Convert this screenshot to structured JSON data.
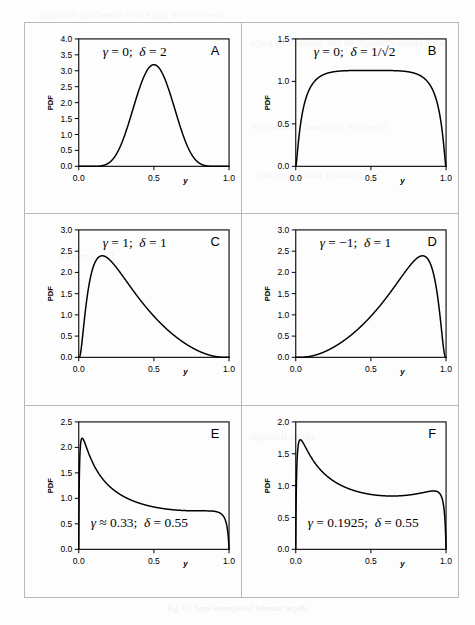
{
  "figure": {
    "caption": "Fig. D1 Some examples of Johnson Sʙ pdfs",
    "panel_count": 6,
    "xlabel": "y",
    "ylabel": "PDF"
  },
  "ghost_text": [
    {
      "text": "the reverse page text bleeding through",
      "x": 40,
      "y": 8
    },
    {
      "text": "faint show-through of the preceding page",
      "x": 250,
      "y": 36
    },
    {
      "text": "illegible reversed characters",
      "x": 252,
      "y": 120
    },
    {
      "text": "ghosted paragraph text",
      "x": 254,
      "y": 168
    },
    {
      "text": "faint marks",
      "x": 60,
      "y": 250
    },
    {
      "text": "show through",
      "x": 250,
      "y": 430
    }
  ],
  "chart_data": [
    {
      "id": "A",
      "type": "line",
      "letter": "A",
      "annotation": "γ = 0 ; δ = 2",
      "annotation_parts": {
        "gamma_symbol": "γ",
        "gamma_value": "0",
        "delta_symbol": "δ",
        "delta_value": "2"
      },
      "gamma": 0,
      "delta": 2,
      "title": "",
      "xlabel": "y",
      "ylabel": "PDF",
      "xlim": [
        0,
        1
      ],
      "ylim": [
        0,
        4.0
      ],
      "xticks": [
        0.0,
        0.5,
        1.0
      ],
      "xticklabels": [
        "0.0",
        "0.5",
        "1.0"
      ],
      "yticks": [
        0.0,
        0.5,
        1.0,
        1.5,
        2.0,
        2.5,
        3.0,
        3.5,
        4.0
      ],
      "yticklabels": [
        "0.0",
        "0.5",
        "1.0",
        "1.5",
        "2.0",
        "2.5",
        "3.0",
        "3.5",
        "4.0"
      ],
      "grid": false,
      "legend": null,
      "peak": {
        "y": 0.5,
        "pdf": 3.19
      }
    },
    {
      "id": "B",
      "type": "line",
      "letter": "B",
      "annotation": "γ = 0; δ = 1/√2",
      "annotation_parts": {
        "gamma_symbol": "γ",
        "gamma_value": "0",
        "delta_symbol": "δ",
        "delta_value": "1/√2"
      },
      "gamma": 0,
      "delta": 0.7071067811865476,
      "title": "",
      "xlabel": "y",
      "ylabel": "PDF",
      "xlim": [
        0,
        1
      ],
      "ylim": [
        0,
        1.5
      ],
      "xticks": [
        0.0,
        0.5,
        1.0
      ],
      "xticklabels": [
        "0.0",
        "0.5",
        "1.0"
      ],
      "yticks": [
        0.0,
        0.5,
        1.0,
        1.5
      ],
      "yticklabels": [
        "0.0",
        "0.5",
        "1.0",
        "1.5"
      ],
      "grid": false,
      "legend": null,
      "peak": {
        "y": 0.5,
        "pdf": 1.13
      }
    },
    {
      "id": "C",
      "type": "line",
      "letter": "C",
      "annotation": "γ = 1; δ = 1",
      "annotation_parts": {
        "gamma_symbol": "γ",
        "gamma_value": "1",
        "delta_symbol": "δ",
        "delta_value": "1"
      },
      "gamma": 1,
      "delta": 1,
      "title": "",
      "xlabel": "y",
      "ylabel": "PDF",
      "xlim": [
        0,
        1
      ],
      "ylim": [
        0,
        3.0
      ],
      "xticks": [
        0.0,
        0.5,
        1.0
      ],
      "xticklabels": [
        "0.0",
        "0.5",
        "1.0"
      ],
      "yticks": [
        0.0,
        0.5,
        1.0,
        1.5,
        2.0,
        2.5,
        3.0
      ],
      "yticklabels": [
        "0.0",
        "0.5",
        "1.0",
        "1.5",
        "2.0",
        "2.5",
        "3.0"
      ],
      "grid": false,
      "legend": null,
      "peak": {
        "y": 0.16,
        "pdf": 2.41
      }
    },
    {
      "id": "D",
      "type": "line",
      "letter": "D",
      "annotation": "γ = −1; δ = 1",
      "annotation_parts": {
        "gamma_symbol": "γ",
        "gamma_value": "−1",
        "delta_symbol": "δ",
        "delta_value": "1"
      },
      "gamma": -1,
      "delta": 1,
      "title": "",
      "xlabel": "y",
      "ylabel": "PDF",
      "xlim": [
        0,
        1
      ],
      "ylim": [
        0,
        3.0
      ],
      "xticks": [
        0.0,
        0.5,
        1.0
      ],
      "xticklabels": [
        "0.0",
        "0.5",
        "1.0"
      ],
      "yticks": [
        0.0,
        0.5,
        1.0,
        1.5,
        2.0,
        2.5,
        3.0
      ],
      "yticklabels": [
        "0.0",
        "0.5",
        "1.0",
        "1.5",
        "2.0",
        "2.5",
        "3.0"
      ],
      "grid": false,
      "legend": null,
      "peak": {
        "y": 0.84,
        "pdf": 2.41
      }
    },
    {
      "id": "E",
      "type": "line",
      "letter": "E",
      "annotation": "γ ≈ 0.33; δ = 0.55",
      "annotation_parts": {
        "gamma_symbol": "γ",
        "gamma_value": "≈ 0.33",
        "delta_symbol": "δ",
        "delta_value": "0.55"
      },
      "gamma": 0.33,
      "delta": 0.55,
      "title": "",
      "xlabel": "y",
      "ylabel": "PDF",
      "xlim": [
        0,
        1
      ],
      "ylim": [
        0,
        2.5
      ],
      "xticks": [
        0.0,
        0.5,
        1.0
      ],
      "xticklabels": [
        "0.0",
        "0.5",
        "1.0"
      ],
      "yticks": [
        0.0,
        0.5,
        1.0,
        1.5,
        2.0,
        2.5
      ],
      "yticklabels": [
        "0.0",
        "0.5",
        "1.0",
        "1.5",
        "2.0",
        "2.5"
      ],
      "grid": false,
      "legend": null,
      "peak": {
        "y": 0.035,
        "pdf": 2.18
      }
    },
    {
      "id": "F",
      "type": "line",
      "letter": "F",
      "annotation": "γ = 0.1925 ; δ = 0.55",
      "annotation_parts": {
        "gamma_symbol": "γ",
        "gamma_value": "0.1925",
        "delta_symbol": "δ",
        "delta_value": "0.55"
      },
      "gamma": 0.1925,
      "delta": 0.55,
      "title": "",
      "xlabel": "y",
      "ylabel": "PDF",
      "xlim": [
        0,
        1
      ],
      "ylim": [
        0,
        2.0
      ],
      "xticks": [
        0.0,
        0.5,
        1.0
      ],
      "xticklabels": [
        "0.0",
        "0.5",
        "1.0"
      ],
      "yticks": [
        0.0,
        0.5,
        1.0,
        1.5,
        2.0
      ],
      "yticklabels": [
        "0.0",
        "0.5",
        "1.0",
        "1.5",
        "2.0"
      ],
      "grid": false,
      "legend": null,
      "peak": {
        "y": 0.04,
        "pdf": 1.71
      }
    }
  ]
}
